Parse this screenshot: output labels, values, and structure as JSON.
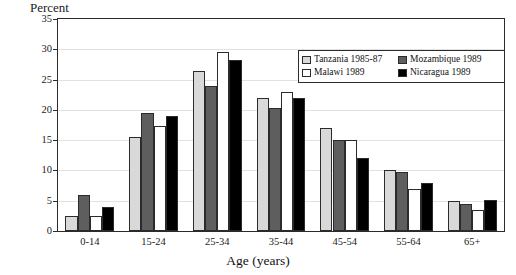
{
  "chart_data": {
    "type": "bar",
    "title": "",
    "xlabel": "Age (years)",
    "ylabel": "Percent",
    "ylim": [
      0,
      35
    ],
    "yticks": [
      0,
      5,
      10,
      15,
      20,
      25,
      30,
      35
    ],
    "grid": true,
    "legend_position": "top-right",
    "categories": [
      "0-14",
      "15-24",
      "25-34",
      "35-44",
      "45-54",
      "55-64",
      "65+"
    ],
    "series": [
      {
        "name": "Tanzania 1985-87",
        "color": "#d9d9d9",
        "values": [
          2.5,
          15.5,
          26.5,
          22.0,
          17.0,
          10.0,
          5.0
        ]
      },
      {
        "name": "Mozambique 1989",
        "color": "#5e5e5e",
        "values": [
          6.0,
          19.5,
          24.0,
          20.3,
          15.0,
          9.7,
          4.5
        ]
      },
      {
        "name": "Malawi 1989",
        "color": "#ffffff",
        "values": [
          2.5,
          17.3,
          29.5,
          23.0,
          15.0,
          7.0,
          3.5
        ]
      },
      {
        "name": "Nicaragua 1989",
        "color": "#000000",
        "values": [
          4.0,
          19.0,
          28.2,
          22.0,
          12.0,
          8.0,
          5.2
        ]
      }
    ]
  },
  "legend": {
    "entries": [
      {
        "label": "Tanzania 1985-87",
        "color": "#d9d9d9"
      },
      {
        "label": "Mozambique 1989",
        "color": "#5e5e5e"
      },
      {
        "label": "Malawi 1989",
        "color": "#ffffff"
      },
      {
        "label": "Nicaragua 1989",
        "color": "#000000"
      }
    ]
  }
}
